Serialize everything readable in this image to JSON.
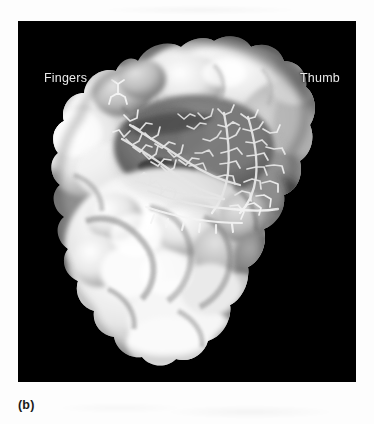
{
  "figure": {
    "panel_caption": "(b)",
    "background_color": "#000000",
    "page_color": "#ffffff",
    "label_color": "#eaeaea",
    "caption_color": "#1a1a1a",
    "render_style": "grayscale-solvent-accessible-surface-with-stick-model-ligand"
  },
  "labels": [
    {
      "name": "fingers",
      "text": "Fingers",
      "x": 26,
      "y": 50
    },
    {
      "name": "thumb",
      "text": "Thumb",
      "x": 282,
      "y": 50
    }
  ],
  "panel": {
    "x": 18,
    "y": 21,
    "width": 338,
    "height": 361
  },
  "structure": {
    "description": "Grayscale molecular surface of a polymerase viewed down the active-site cleft; bright fingers lobe at upper left, grey thumb lobe at right, broad palm/body below, with a white stick-model nucleic acid duplex bound in the central cleft.",
    "surface_highlight": "#f6f6f6",
    "surface_midtone": "#b9b9b9",
    "surface_shadow": "#5a5a5a",
    "stick_color": "#f2f2f2"
  }
}
